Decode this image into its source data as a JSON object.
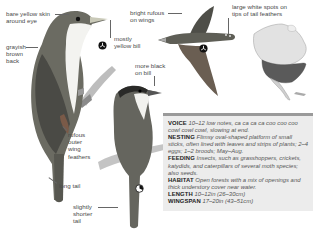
{
  "annotations": {
    "adult_perched": {
      "eye_skin": "bare yellow skin\naround eye",
      "back": "grayish-\nbrown\nback",
      "bill": "mostly\nyellow bill",
      "wing": "rufous\nouter\nwing\nfeathers",
      "tail": "long tail"
    },
    "juvenile": {
      "bill": "more black\non bill",
      "tail": "slightly\nshorter\ntail"
    },
    "flight": {
      "wings": "bright rufous\non wings",
      "tail": "large white spots on\ntips of tail feathers"
    }
  },
  "symbols": {
    "adult": "adult-symbol",
    "flight": "adult-symbol",
    "juvenile": "juvenile-symbol"
  },
  "map": {
    "region": "North America",
    "range_color": "#555555"
  },
  "facts": [
    {
      "key": "VOICE",
      "value": "10–12 low notes, ca ca ca ca coo coo coo cowl cowl cowl, slowing at end."
    },
    {
      "key": "NESTING",
      "value": "Flimsy oval-shaped platform of small sticks, often lined with leaves and strips of plants; 2–4 eggs; 1–2 broods; May–Aug."
    },
    {
      "key": "FEEDING",
      "value": "Insects, such as grasshoppers, crickets, katydids, and caterpillars of several moth species; also seeds."
    },
    {
      "key": "HABITAT",
      "value": "Open forests with a mix of openings and thick understory cover near water."
    },
    {
      "key": "LENGTH",
      "value": "10–12in (26–30cm)"
    },
    {
      "key": "WINGSPAN",
      "value": "17–20in (43–51cm)"
    }
  ],
  "colors": {
    "box_bg": "#ececec",
    "box_rule": "#9a9a9a",
    "label_text": "#4a4a4a"
  }
}
